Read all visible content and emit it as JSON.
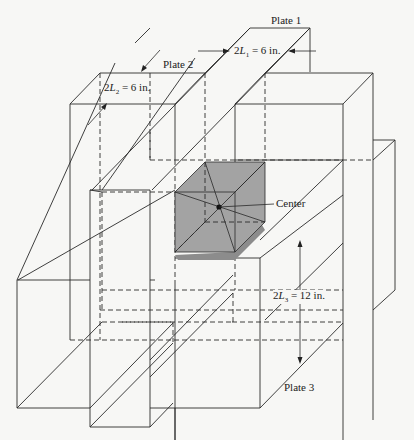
{
  "figure": {
    "labels": {
      "plate1": "Plate 1",
      "plate2": "Plate 2",
      "plate3": "Plate 3",
      "center": "Center",
      "dim1_prefix": "2",
      "dim1_var": "L",
      "dim1_sub": "1",
      "dim1_value": " = 6 in.",
      "dim2_prefix": "2",
      "dim2_var": "L",
      "dim2_sub": "2",
      "dim2_value": " = 6 in.",
      "dim3_prefix": "2",
      "dim3_var": "L",
      "dim3_sub": "3",
      "dim3_value": " = 12 in."
    },
    "colors": {
      "background": "#f7f7f5",
      "line": "#2a2a2a",
      "shade_top": "#a3a3a3",
      "shade_side": "#8c8c8c"
    }
  }
}
